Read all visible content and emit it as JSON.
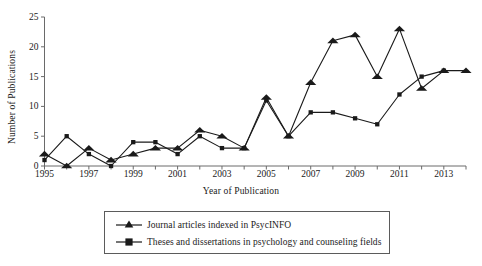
{
  "chart_data": {
    "type": "line",
    "title": "",
    "xlabel": "Year of Publication",
    "ylabel": "Number of Publications",
    "xlim": [
      1995,
      2014
    ],
    "ylim": [
      0,
      25
    ],
    "grid": false,
    "legend_position": "below-center",
    "x": [
      1995,
      1996,
      1997,
      1998,
      1999,
      2000,
      2001,
      2002,
      2003,
      2004,
      2005,
      2006,
      2007,
      2008,
      2009,
      2010,
      2011,
      2012,
      2013,
      2014
    ],
    "xtick_labels": [
      "1995",
      "1997",
      "1999",
      "2001",
      "2003",
      "2005",
      "2007",
      "2009",
      "2011",
      "2013"
    ],
    "xtick_values": [
      1995,
      1997,
      1999,
      2001,
      2003,
      2005,
      2007,
      2009,
      2011,
      2013
    ],
    "xtick_minor_values": [
      1996,
      1998,
      2000,
      2002,
      2004,
      2006,
      2008,
      2010,
      2012,
      2014
    ],
    "ytick_labels": [
      "0",
      "5",
      "10",
      "15",
      "20",
      "25"
    ],
    "ytick_values": [
      0,
      5,
      10,
      15,
      20,
      25
    ],
    "series": [
      {
        "name": "Journal articles indexed in PsycINFO",
        "marker": "triangle",
        "color": "#1a1a1a",
        "x": [
          1995,
          1996,
          1997,
          1998,
          1999,
          2000,
          2001,
          2002,
          2003,
          2004,
          2005,
          2006,
          2007,
          2008,
          2009,
          2010,
          2011,
          2012,
          2013,
          2014
        ],
        "values": [
          2,
          0,
          3,
          1,
          2,
          3,
          3,
          6,
          5,
          3,
          11.5,
          5,
          14,
          21,
          22,
          15,
          23,
          13,
          16,
          16
        ]
      },
      {
        "name": "Theses and dissertations in psychology and counseling fields",
        "marker": "square",
        "color": "#1a1a1a",
        "x": [
          1995,
          1996,
          1997,
          1998,
          1999,
          2000,
          2001,
          2002,
          2003,
          2004,
          2005,
          2006,
          2007,
          2008,
          2009,
          2010,
          2011,
          2012,
          2013
        ],
        "values": [
          1,
          5,
          2,
          0,
          4,
          4,
          2,
          5,
          3,
          3,
          11,
          5,
          9,
          9,
          8,
          7,
          12,
          15,
          16
        ]
      }
    ]
  },
  "legend": {
    "items": [
      {
        "label": "Journal articles indexed in PsycINFO",
        "marker": "triangle"
      },
      {
        "label": "Theses and dissertations in psychology and counseling fields",
        "marker": "square"
      }
    ]
  },
  "axes": {
    "x_title": "Year of Publication",
    "y_title": "Number of Publications"
  }
}
